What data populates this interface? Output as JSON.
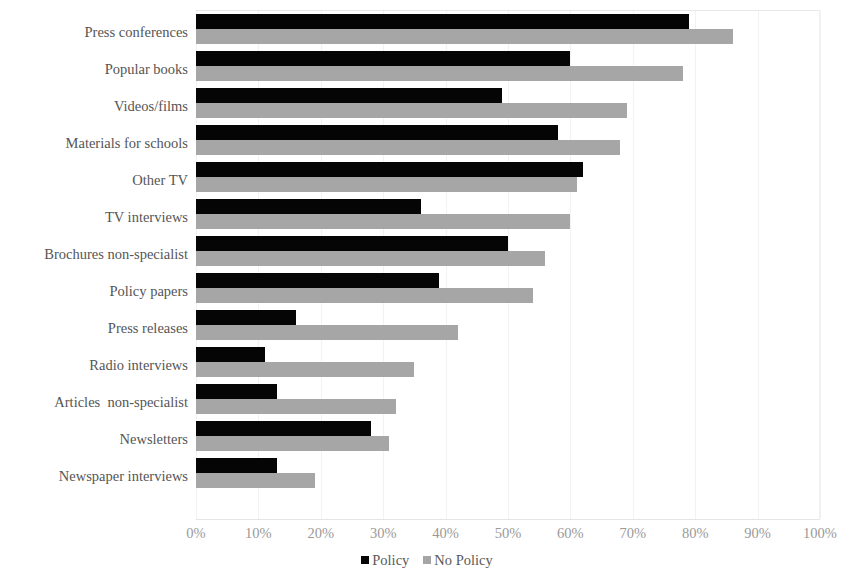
{
  "chart_data": {
    "type": "bar",
    "orientation": "horizontal",
    "title": "",
    "subtitle": "",
    "xlabel": "",
    "ylabel": "",
    "xlim": [
      0,
      100
    ],
    "xticks": [
      "0%",
      "10%",
      "20%",
      "30%",
      "40%",
      "50%",
      "60%",
      "70%",
      "80%",
      "90%",
      "100%"
    ],
    "xtick_values": [
      0,
      10,
      20,
      30,
      40,
      50,
      60,
      70,
      80,
      90,
      100
    ],
    "grid": true,
    "legend_position": "bottom",
    "categories": [
      "Press conferences",
      "Popular books",
      "Videos/films",
      "Materials for schools",
      "Other TV",
      "TV interviews",
      "Brochures non-specialist",
      "Policy papers",
      "Press releases",
      "Radio interviews",
      "Articles  non-specialist",
      "Newsletters",
      "Newspaper interviews"
    ],
    "series": [
      {
        "name": "Policy",
        "color": "#050505",
        "values": [
          79,
          60,
          49,
          58,
          62,
          36,
          50,
          39,
          16,
          11,
          13,
          28,
          13
        ]
      },
      {
        "name": "No Policy",
        "color": "#a6a6a6",
        "values": [
          86,
          78,
          69,
          68,
          61,
          60,
          56,
          54,
          42,
          35,
          32,
          31,
          19
        ]
      }
    ]
  }
}
